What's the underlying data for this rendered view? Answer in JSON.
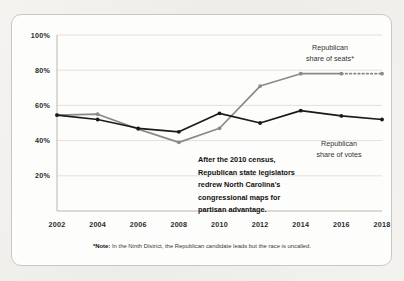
{
  "chart_data": {
    "type": "line",
    "title": "",
    "subtitle": "",
    "xlabel": "",
    "ylabel": "",
    "x": [
      2002,
      2004,
      2006,
      2008,
      2010,
      2012,
      2014,
      2016,
      2018
    ],
    "categories": [
      "2002",
      "2004",
      "2006",
      "2008",
      "2010",
      "2012",
      "2014",
      "2016",
      "2018"
    ],
    "xlim": [
      2002,
      2018
    ],
    "ylim": [
      0,
      100
    ],
    "yticks": [
      20,
      40,
      60,
      80,
      100
    ],
    "ytick_labels": [
      "20%",
      "40%",
      "60%",
      "80%",
      "100%"
    ],
    "xtick_labels": [
      "2002",
      "2004",
      "2006",
      "2008",
      "2010",
      "2012",
      "2014",
      "2016",
      "2018"
    ],
    "grid": "horizontal",
    "legend_position": "inline-right",
    "series": [
      {
        "name": "Republican share of votes",
        "color": "#1a1a1a",
        "style": "solid",
        "values": [
          54.5,
          52.0,
          47.0,
          45.0,
          55.5,
          50.0,
          57.0,
          54.0,
          52.0
        ]
      },
      {
        "name": "Republican share of seats*",
        "color": "#8a8a8a",
        "style": "solid-with-dashed-tail",
        "dashed_from": 2016,
        "values": [
          54.5,
          55.0,
          46.5,
          39.0,
          47.0,
          71.0,
          78.0,
          78.0,
          78.0
        ]
      }
    ],
    "annotations": [
      {
        "name": "redistricting-note",
        "lines": [
          "After the 2010 census,",
          "Republican state legislators",
          "redrew North Carolina's",
          "congressional maps for",
          "partisan advantage."
        ]
      }
    ]
  },
  "legend": {
    "seats": {
      "line1": "Republican",
      "line2": "share of seats*"
    },
    "votes": {
      "line1": "Republican",
      "line2": "share of votes"
    }
  },
  "footnote": {
    "marker": "*Note:",
    "text": " In the Ninth District, the Republican candidate leads but the race is uncalled."
  },
  "colors": {
    "votes_line": "#1a1a1a",
    "seats_line": "#8a8a8a",
    "grid": "#e2e0dc",
    "axis": "#b9b7b2",
    "card_border": "#c9c7c2",
    "card_bg": "#fdfdfc",
    "page_bg": "#f2f1ee"
  }
}
